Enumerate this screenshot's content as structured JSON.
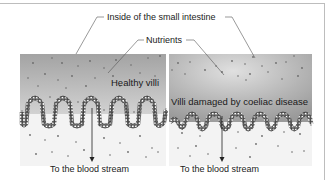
{
  "diagram": {
    "title_label": "Inside of the small intestine",
    "nutrients_label": "Nutrients",
    "panels": [
      {
        "id": "healthy",
        "caption": "Healthy villi",
        "bottom_label": "To the blood stream"
      },
      {
        "id": "damaged",
        "caption": "Villi damaged by coeliac disease",
        "bottom_label": "To the blood stream"
      }
    ],
    "colors": {
      "lumen_top": "#9e9e9e",
      "lumen_bottom": "#d6d6d6",
      "tissue": "#f2f2f2",
      "villi_outline": "#333333",
      "particle": "#6a6a6a",
      "frame": "#bdbdbd"
    }
  }
}
